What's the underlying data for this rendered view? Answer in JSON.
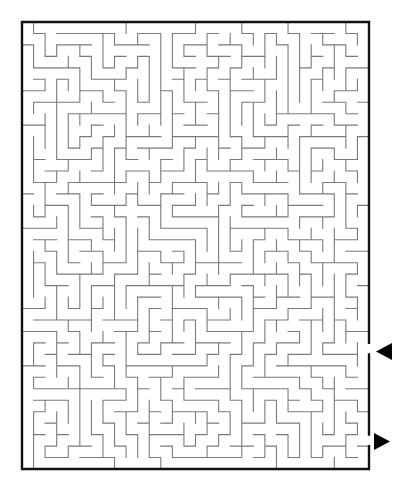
{
  "puzzle": {
    "title": "Maze",
    "type": "rectangular-maze",
    "instructions": "Enter at the upper arrow on the right side and find the path to the lower arrow."
  },
  "canvas": {
    "width": 412,
    "height": 492,
    "background": "#ffffff"
  },
  "frame": {
    "x": 22,
    "y": 22,
    "width": 347,
    "height": 447,
    "stroke": "#111111",
    "stroke_width": 2.4
  },
  "grid": {
    "cols": 30,
    "rows": 39,
    "wall_color": "#7a7a7a",
    "wall_width": 1.1,
    "seed": 48213,
    "bias_horizontal": 0.5,
    "braid": 0.0
  },
  "openings": [
    {
      "id": "entrance",
      "side": "right",
      "row": 28,
      "label": "Start"
    },
    {
      "id": "exit",
      "side": "right",
      "row": 36,
      "label": "Finish"
    }
  ],
  "arrows": [
    {
      "id": "entrance-arrow",
      "direction": "left",
      "x": 376,
      "y": 343,
      "w": 16,
      "h": 17,
      "color": "#000000"
    },
    {
      "id": "exit-arrow",
      "direction": "right",
      "x": 374,
      "y": 433,
      "w": 16,
      "h": 17,
      "color": "#000000"
    }
  ]
}
